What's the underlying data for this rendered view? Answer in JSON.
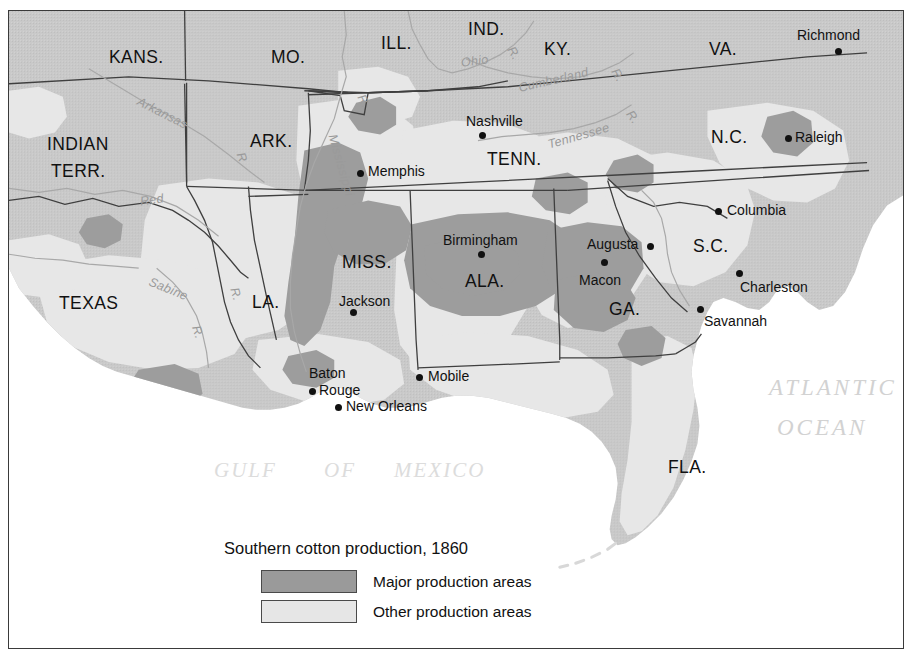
{
  "map": {
    "title": "Southern cotton production, 1860",
    "colors": {
      "land": "#c9c9c9",
      "major_production": "#9a9a9a",
      "other_production": "#e6e6e6",
      "water": "#ffffff",
      "border": "#3a3a3a",
      "river": "#9a9a9a",
      "ocean_label": "#d2d2d2"
    },
    "states": [
      {
        "name": "KANS.",
        "x": 100,
        "y": 38,
        "size": "state"
      },
      {
        "name": "MO.",
        "x": 262,
        "y": 38,
        "size": "state"
      },
      {
        "name": "ILL.",
        "x": 372,
        "y": 24,
        "size": "state"
      },
      {
        "name": "IND.",
        "x": 459,
        "y": 10,
        "size": "state"
      },
      {
        "name": "KY.",
        "x": 535,
        "y": 30,
        "size": "state"
      },
      {
        "name": "VA.",
        "x": 700,
        "y": 30,
        "size": "state"
      },
      {
        "name": "INDIAN",
        "x": 38,
        "y": 125,
        "size": "state"
      },
      {
        "name": "TERR.",
        "x": 42,
        "y": 152,
        "size": "state"
      },
      {
        "name": "ARK.",
        "x": 241,
        "y": 122,
        "size": "state"
      },
      {
        "name": "TENN.",
        "x": 478,
        "y": 140,
        "size": "state"
      },
      {
        "name": "N.C.",
        "x": 702,
        "y": 118,
        "size": "state"
      },
      {
        "name": "S.C.",
        "x": 684,
        "y": 227,
        "size": "state"
      },
      {
        "name": "MISS.",
        "x": 333,
        "y": 243,
        "size": "state"
      },
      {
        "name": "ALA.",
        "x": 456,
        "y": 262,
        "size": "state"
      },
      {
        "name": "GA.",
        "x": 600,
        "y": 290,
        "size": "state"
      },
      {
        "name": "LA.",
        "x": 243,
        "y": 283,
        "size": "state"
      },
      {
        "name": "TEXAS",
        "x": 50,
        "y": 284,
        "size": "state"
      },
      {
        "name": "FLA.",
        "x": 659,
        "y": 448,
        "size": "state"
      }
    ],
    "cities": [
      {
        "name": "Richmond",
        "lx": 788,
        "ly": 17,
        "dx": 826,
        "dy": 37
      },
      {
        "name": "Raleigh",
        "lx": 786,
        "ly": 119,
        "dx": 776,
        "dy": 124
      },
      {
        "name": "Nashville",
        "lx": 457,
        "ly": 103,
        "dx": 470,
        "dy": 121
      },
      {
        "name": "Memphis",
        "lx": 359,
        "ly": 153,
        "dx": 348,
        "dy": 159
      },
      {
        "name": "Columbia",
        "lx": 718,
        "ly": 192,
        "dx": 706,
        "dy": 197
      },
      {
        "name": "Augusta",
        "lx": 578,
        "ly": 226,
        "dx": 638,
        "dy": 232
      },
      {
        "name": "Macon",
        "lx": 570,
        "ly": 262,
        "dx": 592,
        "dy": 248
      },
      {
        "name": "Birmingham",
        "lx": 434,
        "ly": 222,
        "dx": 469,
        "dy": 240
      },
      {
        "name": "Jackson",
        "lx": 330,
        "ly": 283,
        "dx": 341,
        "dy": 298
      },
      {
        "name": "Charleston",
        "lx": 731,
        "ly": 269,
        "dx": 727,
        "dy": 259
      },
      {
        "name": "Savannah",
        "lx": 695,
        "ly": 303,
        "dx": 688,
        "dy": 295
      },
      {
        "name": "Baton",
        "lx": 300,
        "ly": 355,
        "dx": -1,
        "dy": -1
      },
      {
        "name": "Rouge",
        "lx": 310,
        "ly": 372,
        "dx": 300,
        "dy": 377
      },
      {
        "name": "Mobile",
        "lx": 419,
        "ly": 358,
        "dx": 407,
        "dy": 363
      },
      {
        "name": "New Orleans",
        "lx": 337,
        "ly": 388,
        "dx": 326,
        "dy": 393
      }
    ],
    "rivers": [
      {
        "name": "Arkansas",
        "x": 126,
        "y": 96,
        "rot": 27
      },
      {
        "name": "R",
        "x": 228,
        "y": 140,
        "rot": 70
      },
      {
        "name": "Red",
        "x": 131,
        "y": 183,
        "rot": -8
      },
      {
        "name": "Mississippi",
        "x": 300,
        "y": 148,
        "rot": 74
      },
      {
        "name": "R.",
        "x": 348,
        "y": 84,
        "rot": 62
      },
      {
        "name": "Sabine",
        "x": 139,
        "y": 272,
        "rot": 22
      },
      {
        "name": "R.",
        "x": 182,
        "y": 315,
        "rot": 72
      },
      {
        "name": "R.",
        "x": 220,
        "y": 277,
        "rot": 74
      },
      {
        "name": "Ohio",
        "x": 452,
        "y": 44,
        "rot": -7
      },
      {
        "name": "R.",
        "x": 498,
        "y": 36,
        "rot": 58
      },
      {
        "name": "Cumberland",
        "x": 509,
        "y": 63,
        "rot": -13
      },
      {
        "name": "R.",
        "x": 602,
        "y": 58,
        "rot": 60
      },
      {
        "name": "Tennessee",
        "x": 538,
        "y": 119,
        "rot": -16
      },
      {
        "name": "R.",
        "x": 617,
        "y": 100,
        "rot": 54
      }
    ],
    "oceans": [
      {
        "name": "ATLANTIC",
        "x": 760,
        "y": 365,
        "cls": "ocean"
      },
      {
        "name": "OCEAN",
        "x": 768,
        "y": 405,
        "cls": "ocean"
      },
      {
        "name": "GULF",
        "x": 205,
        "y": 449,
        "cls": "ocean gulf"
      },
      {
        "name": "OF",
        "x": 315,
        "y": 449,
        "cls": "ocean gulf"
      },
      {
        "name": "MEXICO",
        "x": 385,
        "y": 449,
        "cls": "ocean gulf"
      }
    ],
    "legend": {
      "items": [
        {
          "label": "Major production areas",
          "swatch": "sw-major"
        },
        {
          "label": "Other production areas",
          "swatch": "sw-other"
        }
      ]
    }
  }
}
